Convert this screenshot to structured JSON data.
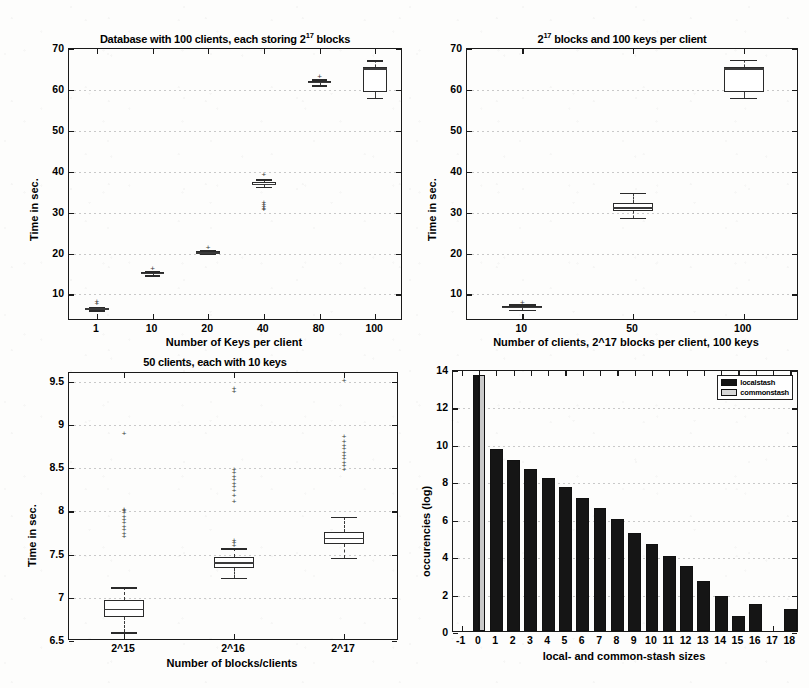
{
  "figure": {
    "background": "#fdfdfc",
    "ink": "#1a1a1a"
  },
  "chart_data": [
    {
      "id": "panel1",
      "type": "box",
      "title_parts": {
        "pre": "Database with 100 clients, each storing 2",
        "sup": "17",
        "post": " blocks"
      },
      "title": "Database with 100 clients, each storing 2^17 blocks",
      "xlabel": "Number of Keys per client",
      "ylabel": "Time in sec.",
      "categories": [
        "1",
        "10",
        "20",
        "40",
        "80",
        "100"
      ],
      "ylim": [
        3.5,
        70
      ],
      "yticks": [
        10,
        20,
        30,
        40,
        50,
        60,
        70
      ],
      "grid": true,
      "boxes": [
        {
          "category": "1",
          "whisker_low": 6.1,
          "q1": 6.4,
          "median": 6.6,
          "q3": 6.8,
          "whisker_high": 7.0,
          "outliers": [
            7.6,
            8.2
          ]
        },
        {
          "category": "10",
          "whisker_low": 14.7,
          "q1": 15.0,
          "median": 15.2,
          "q3": 15.4,
          "whisker_high": 15.7,
          "outliers": [
            16.1
          ]
        },
        {
          "category": "20",
          "whisker_low": 19.9,
          "q1": 20.1,
          "median": 20.3,
          "q3": 20.6,
          "whisker_high": 20.9,
          "outliers": [
            21.3
          ]
        },
        {
          "category": "40",
          "whisker_low": 36.3,
          "q1": 36.8,
          "median": 37.1,
          "q3": 37.5,
          "whisker_high": 38.1,
          "outliers": [
            39.2,
            32.4,
            31.8,
            31.4,
            31.0,
            30.6
          ]
        },
        {
          "category": "80",
          "whisker_low": 61.1,
          "q1": 61.6,
          "median": 61.9,
          "q3": 62.2,
          "whisker_high": 62.6,
          "outliers": [
            63.1
          ]
        },
        {
          "category": "100",
          "whisker_low": 58.0,
          "q1": 59.6,
          "median": 65.3,
          "q3": 65.5,
          "whisker_high": 67.2,
          "outliers": []
        }
      ]
    },
    {
      "id": "panel2",
      "type": "box",
      "title_parts": {
        "pre": "2",
        "sup": "17",
        "post": " blocks and 100 keys per client"
      },
      "title": "2^17 blocks and 100 keys per client",
      "xlabel": "Number of clients, 2^17 blocks per client, 100 keys",
      "ylabel": "Time in sec.",
      "categories": [
        "10",
        "50",
        "100"
      ],
      "ylim": [
        3.5,
        70
      ],
      "yticks": [
        10,
        20,
        30,
        40,
        50,
        60,
        70
      ],
      "grid": true,
      "boxes": [
        {
          "category": "10",
          "whisker_low": 6.2,
          "q1": 6.6,
          "median": 6.9,
          "q3": 7.2,
          "whisker_high": 7.6,
          "outliers": [
            8.0
          ]
        },
        {
          "category": "50",
          "whisker_low": 28.8,
          "q1": 30.5,
          "median": 31.3,
          "q3": 32.4,
          "whisker_high": 34.9,
          "outliers": []
        },
        {
          "category": "100",
          "whisker_low": 58.0,
          "q1": 59.6,
          "median": 65.3,
          "q3": 65.5,
          "whisker_high": 67.3,
          "outliers": []
        }
      ]
    },
    {
      "id": "panel3",
      "type": "box",
      "title": "50 clients, each with 10 keys",
      "xlabel": "Number of blocks/clients",
      "ylabel": "Time in sec.",
      "categories": [
        "2^15",
        "2^16",
        "2^17"
      ],
      "ylim": [
        6.5,
        9.6
      ],
      "yticks": [
        6.5,
        7,
        7.5,
        8,
        8.5,
        9,
        9.5
      ],
      "grid": true,
      "boxes": [
        {
          "category": "2^15",
          "whisker_low": 6.6,
          "q1": 6.78,
          "median": 6.87,
          "q3": 6.97,
          "whisker_high": 7.12,
          "outliers": [
            7.7,
            7.74,
            7.78,
            7.82,
            7.86,
            7.9,
            7.94,
            7.98,
            8.0,
            8.01,
            8.9
          ]
        },
        {
          "category": "2^16",
          "whisker_low": 7.23,
          "q1": 7.35,
          "median": 7.41,
          "q3": 7.47,
          "whisker_high": 7.57,
          "outliers": [
            7.6,
            7.63,
            7.66,
            8.11,
            8.18,
            8.24,
            8.28,
            8.32,
            8.36,
            8.4,
            8.44,
            8.48,
            9.38,
            9.42
          ]
        },
        {
          "category": "2^17",
          "whisker_low": 7.46,
          "q1": 7.62,
          "median": 7.69,
          "q3": 7.76,
          "whisker_high": 7.94,
          "outliers": [
            8.48,
            8.52,
            8.56,
            8.6,
            8.64,
            8.68,
            8.72,
            8.76,
            8.8,
            8.86,
            9.51
          ]
        }
      ]
    },
    {
      "id": "panel4",
      "type": "bar",
      "title": "",
      "xlabel": "local- and common-stash sizes",
      "ylabel": "occurencies (log)",
      "categories": [
        "-1",
        "0",
        "1",
        "2",
        "3",
        "4",
        "5",
        "6",
        "7",
        "8",
        "9",
        "10",
        "11",
        "12",
        "13",
        "14",
        "15",
        "16",
        "17",
        "18"
      ],
      "xticks": [
        "-1",
        "0",
        "1",
        "2",
        "3",
        "4",
        "5",
        "6",
        "7",
        "8",
        "9",
        "10",
        "11",
        "12",
        "13",
        "14",
        "15",
        "16",
        "17",
        "18"
      ],
      "yticks": [
        0,
        2,
        4,
        6,
        8,
        10,
        12,
        14
      ],
      "ylim": [
        0,
        14
      ],
      "grid": true,
      "legend_position": "top-right",
      "series": [
        {
          "name": "localstash",
          "color": "#151515",
          "values": [
            0,
            13.7,
            9.75,
            9.15,
            8.68,
            8.17,
            7.68,
            7.1,
            6.6,
            6.0,
            5.23,
            4.65,
            4.0,
            3.5,
            2.68,
            1.85,
            0.78,
            1.42,
            0,
            1.18
          ]
        },
        {
          "name": "commonstash",
          "color": "#c9c9c9",
          "values": [
            0,
            13.68,
            0,
            0,
            0,
            0,
            0,
            0,
            0,
            0,
            0,
            0,
            0,
            0,
            0,
            0,
            0,
            0,
            0,
            0
          ]
        }
      ]
    }
  ]
}
